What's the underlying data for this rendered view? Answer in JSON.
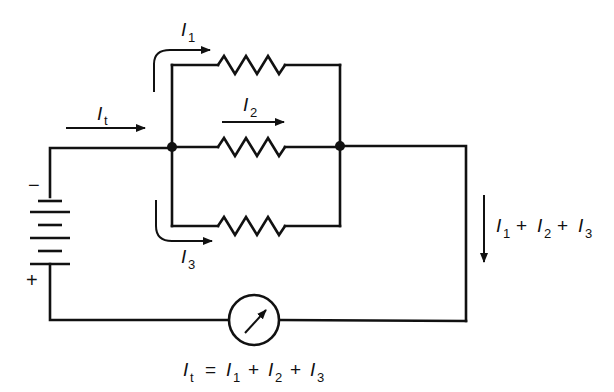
{
  "diagram": {
    "battery": {
      "negative_label": "−",
      "positive_label": "+"
    },
    "currents": {
      "total": {
        "symbol": "I",
        "subscript": "t"
      },
      "branch1": {
        "symbol": "I",
        "subscript": "1"
      },
      "branch2": {
        "symbol": "I",
        "subscript": "2"
      },
      "branch3": {
        "symbol": "I",
        "subscript": "3"
      }
    },
    "right_label": {
      "terms": [
        {
          "symbol": "I",
          "subscript": "1"
        },
        {
          "symbol": "I",
          "subscript": "2"
        },
        {
          "symbol": "I",
          "subscript": "3"
        }
      ],
      "operator": "+"
    },
    "equation": {
      "lhs": {
        "symbol": "I",
        "subscript": "t"
      },
      "equals": "=",
      "operator": "+",
      "terms": [
        {
          "symbol": "I",
          "subscript": "1"
        },
        {
          "symbol": "I",
          "subscript": "2"
        },
        {
          "symbol": "I",
          "subscript": "3"
        }
      ]
    },
    "components": [
      "battery",
      "resistor-1",
      "resistor-2",
      "resistor-3",
      "ammeter"
    ],
    "colors": {
      "ink": "#111111",
      "background": "#ffffff"
    }
  }
}
